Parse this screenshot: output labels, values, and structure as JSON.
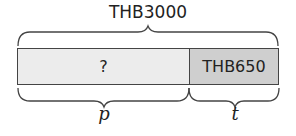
{
  "diagram": {
    "total_label": "THB3000",
    "segments": [
      {
        "id": "p",
        "value_label": "?",
        "variable": "p",
        "fill": "#ececec"
      },
      {
        "id": "t",
        "value_label": "THB650",
        "variable": "t",
        "fill": "#cfcfcf"
      }
    ],
    "stroke_color": "#444444"
  }
}
